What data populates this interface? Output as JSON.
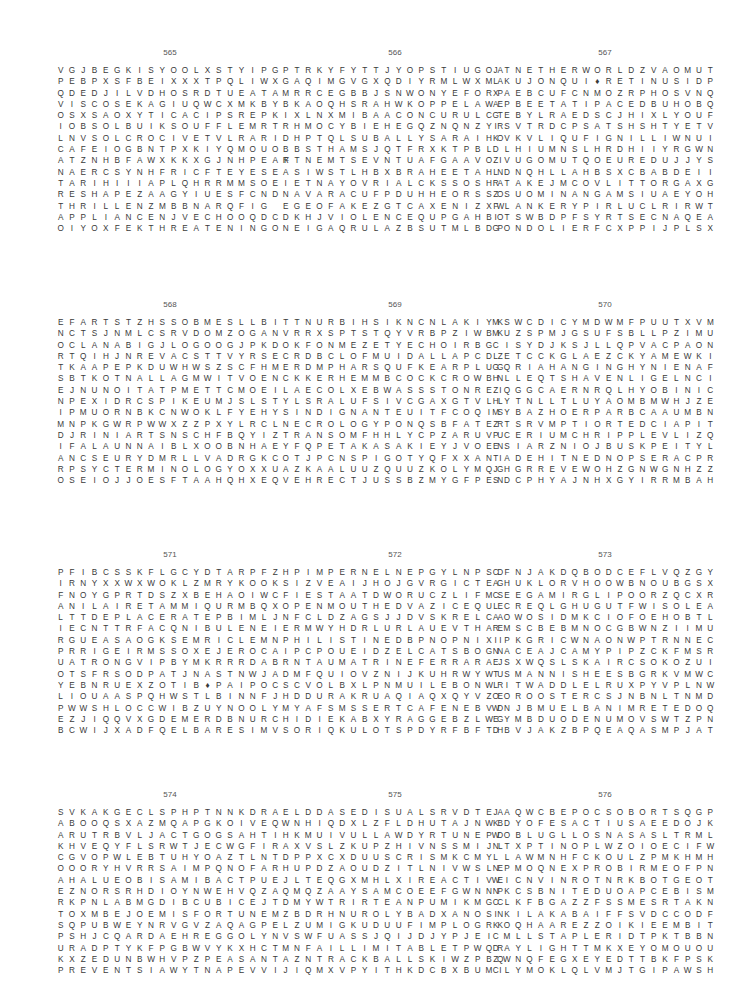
{
  "page": {
    "puzzles": [
      {
        "number": "565",
        "rows": [
          "VGJBEGKISYOOLXSTYIPG",
          "PEBPXSFBEIXXXTPQLIWX",
          "QDEDJILVDHOSRDTUEATA",
          "VISCOSEKAGIUQWCXMKBY",
          "OSXSAOXYTICACIPSREPK",
          "IOBSOLBUIKSOUFFLEMRT",
          "LNVSOLCROCIVETVLRARI",
          "CAFEIOGBNTPXKIYQMOUO",
          "ATZNHBFAWXKKXGJNHPEAF",
          "NAERCSYNHFRICFTEYESE",
          "TARIHIIIAPLQHRRMMSOE",
          "RESHAPEZAAGYIUESFCND",
          "THRILLENZMBBNARQFIG",
          "APPLIANCENJVECHOOQDC",
          "OIYOXFEKTHREATENINGO"
        ]
      },
      {
        "number": "566",
        "rows": [
          "PTRKYFYTTJYOPSTIUGOA",
          "GAQIMGVGXQDIYRMLWXMA",
          "MRRCEGBBJSNWONYEFORP",
          "BKAOQHSRAHWKOPPELAWE",
          "IXLNXMIBAACONCURULCT",
          "RHMOCYBIEHEGQZNQNZYR",
          "DHPTQLSUBALLYSARAIHO",
          "BBSTHAMSJQTFRXKTPBL",
          "RTNEMTSEVNTUAFGAAVOI",
          "ASIWSTLHBXBRAHEETAHN",
          "IETNAYOVRIALCKSSOSHA",
          "NAVARACUFPDUHHEORSSO",
          "EGEOFAKEZGTCAXENIZXW",
          "DKHJVIOLENCEQUPGAHBO",
          "NEIGAQRULAZBSUTMLBDP"
        ]
      },
      {
        "number": "567",
        "rows": [
          "JTNETHERWORLDZVAOMUT",
          "LKUJONQUI♦RETINUSIDP",
          "XAEBCUFCNMOZRPHOSVNQ",
          "APBEETATIPACEDBUHOBQ",
          "GEBYLRAEDSCJHIXLYOUF",
          "ISVTRDCPSATSHSHTYETV",
          "KVKVLIQUFIGNILLIWNUI",
          "DLHIUMNSLHRDHIIYRGWN",
          "ZVUGOMUTQOEUREDUJJYS",
          "LDNQHLLAHBSXCBABDEII",
          "RTAKEJMCOVLITTORGAXG",
          "ZSUOMINANGAMSIUAEYOH",
          "FLANKERYPIRLUCLRIRWT",
          "ITSWBDPFSYRTSECNAQEA",
          "GONDOLIERFCXPPIJPLSX"
        ]
      },
      {
        "number": "568",
        "rows": [
          "EFARTSTZHSSOBMESLLBI",
          "NCTSJNMLCSRVDOMZOGAN",
          "OCLANABIGJLOGOOGJPKD",
          "RTQIHJNREVACSTTVYRSE",
          "TKAAPEPKDUWHWSZSCFHM",
          "SBTKOTNALLAGMWITVOEN",
          "EJNUNOITATPMETTCMOEI",
          "NPEXIDRCSPIKEUMJSLST",
          "IPMUORNBKCNWOKLFYEHY",
          "MNPKGWRPWWXZZPXYLRCL",
          "DJRINIARTSNSCHFBQYIZ",
          "IFALAUNNAIBLXOOBNHAE",
          "ANCSEURYDMRLLVADRGKC",
          "RPSYCTERMINOLOGYOXXU",
          "OSEIOJJOESFTAAHQHXEQ"
        ]
      },
      {
        "number": "569",
        "rows": [
          "TTNURBIHSIKNCNLAKIYK",
          "VRRXSPTSTQYVRBPZIWBK",
          "OKFONMEZETYECHOIRBG",
          "CRDBCLOFMUIDALLAPCDZ",
          "ERDMPHARSQUFKEARPLUG",
          "CKKERHEMMBCOCKCROWBN",
          "LAECOLXEBWASSSTONREI",
          "YLSRALUFSIVCGAXGTVLL",
          "SINDIGNANTEUITFCOQIS",
          "NECROLOGYPONQSBFATER",
          "TRANSOMFHHLYCPZARUVU",
          "YFQPETAKASAKIEYJVOEN",
          "OTJPCNSPIGOTYQFXXANI",
          "AZKAALUUZQUUZKOLYMQG",
          "VEHRECTJUSSBZMYGFPEN"
        ]
      },
      {
        "number": "570",
        "rows": [
          "MSWCDICYMDWMFPUUTXVM",
          "MUZSPMJGSUFSBLLPZIMU",
          "CISYDJKSJLLQPVACPAON",
          "LETCCKGLAEZCKYAMEWKI",
          "GQRIAHANGINGHYNIENAF",
          "HLLEQTSHAVENLIGELNCI",
          "ZQGGCAERNRQLHYOBINIC",
          "HYTNLLTLUYAOMBMWHJZE",
          "MYBAZHOERPARBCAAUMBN",
          "ZTSRVMPTIORTEDCIAPIT",
          "PCERIUMCHRIPPLEVLIZQ",
          "ESIARZNIOJBUSKPEITYL",
          "TADEHITNEDNOPSERACPR",
          "JHGRREVEWOHZGNWGNHZZ",
          "SDCPHYAJNHXGYIRRMBAH"
        ]
      },
      {
        "number": "571",
        "rows": [
          "PFIBCSSKFLGCYDTARPFZ",
          "IRNYXXWXWOKLZMRYKOOK",
          "FNOYGPRTDSZXBEHAOIWC",
          "ANILAIRETAMMIQURMBQX",
          "LTTDEPLACERATEPBIMLJ",
          "IECNTTRFACQNIBULENEI",
          "RGUEASAOGKSEMRICLEMN",
          "PRRIGEIRMSSOXEJEROCA",
          "UATRONGVIPBYMKRRRDAB",
          "OTSFRSODPATJNASTNWJA",
          "YEBNRUEXZOTIB♦PAIPOC",
          "LIOUAASPQHWSTLBINNFJ",
          "PWWSHLOCCWIBZUYNOOLY",
          "EZJIQQVXGDEMERDBNURC",
          "BCWIJXADFQELBARESIMV"
        ]
      },
      {
        "number": "572",
        "rows": [
          "HPIMPERNELNEPGYLNPSD",
          "SIZVEAIJHOJGVRGICTEG",
          "FIESTAATDWORUCZLIFMS",
          "OPENMOUTHEDVAZICEQUE",
          "NFCLDZAGSJJDVSKRELCA",
          "ERMWYHDRLURLAUEVTHAE",
          "PHILISTINEDBPNOPNIXI",
          "IPCPOUEIDZELCATSBOGN",
          "RNTAUMATRINEFERRARAJ",
          "DMFQUIOVZNIJKUHRWYWU",
          "SCVOLBXLPNMUILEBONWR",
          "HDDURAKRUAQIAQXQYVZE",
          "MYAFSMSSERTCAFENEBVD",
          "HIDIEKABXYRAGGEBZLWG",
          "SORIQKULOTSPDYRFBFTH"
        ]
      },
      {
        "number": "573",
        "rows": [
          "CFNJAKDQBODCEFLVQZGY",
          "AHUKLORVHOOWBNOUBGSX",
          "CEEGAMIRGLIPOORZQCXR",
          "LCREQLGHUGUTFWISOLEA",
          "AOWOSIDMKCIOFOEHOBTL",
          "RMSCBEBMNOCGBWNZIIMU",
          "IPKGRICWNAONWPTRNNEC",
          "NACEAJCAMYPIPZCKFMSR",
          "ESXWQSLSKAIRCSOKOZUI",
          "TSMANNISHEESBGRKVMWC",
          "LITWADDLELRUXPYVPLNW",
          "OOROOSTERCSJNBNLTNMD",
          "WNJBMUELBANIMRETEDOQ",
          "EYMBDUODENUMOVSWTZPN",
          "DBVJAKZBPQEAQASMPJAT"
        ]
      },
      {
        "number": "574",
        "rows": [
          "SVKAKGECLSPHPTNNKDRA",
          "ABOOQSXAZMQAPGKOIVEQ",
          "ARUTRBVLJACTGOGSAHTI",
          "KHVEQYFLSRWTJECWGFIR",
          "CGVOPWLEBTUHYOAZTLNT",
          "OOORYHVRRSAIMPQNOFAR",
          "AHALUEOBISAMIBACTPUE",
          "EZNORSRHDIOYNWEHVQZA",
          "RKPNLABMGDIBCUBICEJT",
          "TOXMBEJOEMISFORTUNEM",
          "SQPUBWEYNRVGVZAQAGPE",
          "PSHJCQARDAEHREGGOLYN",
          "URADPTYKFPGBWVYKXHCT",
          "KXZEDUNBWHVPZPEASANT",
          "PREVENTSIAWYTNAPEVVI"
        ]
      },
      {
        "number": "575",
        "rows": [
          "ELDDASEDISUALSRVDTEA",
          "WNHIQDXLZFLDHUTAJNWB",
          "HKMUIVULLAWDYRTUNEPD",
          "AXVSLZKUPZHIVNSSMIJL",
          "DPPXCXDUUSCRISMKCMY",
          "HUPDZAOUDZITLNIVWSLE",
          "JLTEQGXMHLXIREACTIVE",
          "QMQZAAYSAMCOEEFGWNNP",
          "DMYWTRIRTEANPUMIKMGC",
          "ZBDRHNUROLYBADXANOSN",
          "LZUMIGKUDUUFIMPLOGRK",
          "VSWFUASSJQIJDJYPJEI",
          "MNFAILLIMITABLETPWQR",
          "AZNTRACKBALLSKIWZPBQ",
          "JIQMXVPYITHKDCBXBUMI"
        ]
      },
      {
        "number": "576",
        "rows": [
          "JAQWCBEPOCSOBORTSQGP",
          "KDYOFESACTIUSAEEDOJK",
          "WOBLUGLLOSNASASLTRML",
          "NTXPTINOPLWZOIOECIFW",
          "LLAWMNHFCKOULZPMKHMH",
          "NPMOQNEXPROBIRMEOFPN",
          "WICNVINROTNRKBOTGEOT",
          "NKCSBNITEDUOAPCEBISM",
          "CLKFBGAZZFSSMESRTAKN",
          "IKILAKABAIFFSVDCCODF",
          "KOQHAAREZZOIKIEEMBIT",
          "CMLLSTAPLERIDTPKTBBN",
          "DAYLIGHTTMKXEYOMOUOU",
          "ZWNQFEGXEYEDTTBKFPSK",
          "CLYMOKLQLVMJTGIPAWSH"
        ]
      }
    ]
  }
}
